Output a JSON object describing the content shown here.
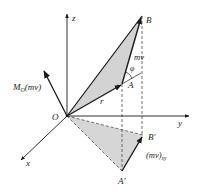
{
  "figure": {
    "labels": {
      "origin": "O",
      "x_axis": "x",
      "y_axis": "y",
      "z_axis": "z",
      "point_A": "A",
      "point_B": "B",
      "point_A_proj": "A'",
      "point_B_proj": "B'",
      "position_vector": "r",
      "momentum": "mv",
      "angle": "φ",
      "moment_main": "M",
      "moment_sub": "O",
      "moment_arg": "(mv)",
      "proj_momentum_main": "(mv)",
      "proj_momentum_sub": "xy"
    },
    "colors": {
      "line": "#1a1a1a",
      "shade": "#d3d3d3",
      "dashed": "#333333"
    }
  }
}
